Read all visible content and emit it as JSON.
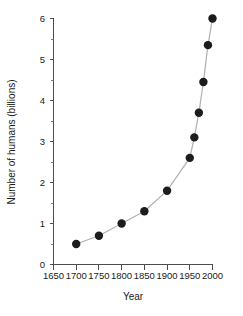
{
  "chart_data": {
    "type": "line",
    "title": "",
    "xlabel": "Year",
    "ylabel": "Number of humans (billions)",
    "xlim": [
      1650,
      2000
    ],
    "ylim": [
      0,
      6
    ],
    "grid": false,
    "legend": null,
    "marker": "filled-circle",
    "line_color": "#b0b0b0",
    "marker_color": "#1c1c1c",
    "x_ticks": [
      1650,
      1700,
      1750,
      1800,
      1850,
      1900,
      1950,
      2000
    ],
    "x_tick_labels": [
      "1650",
      "1700",
      "1750",
      "1800",
      "1850",
      "1900",
      "1950",
      "2000"
    ],
    "y_ticks": [
      0,
      1,
      2,
      3,
      4,
      5,
      6
    ],
    "y_tick_labels": [
      "0",
      "1",
      "2",
      "3",
      "4",
      "5",
      "6"
    ],
    "y_minor_ticks": [
      0.5,
      1.5,
      2.5,
      3.5,
      4.5,
      5.5
    ],
    "x": [
      1700,
      1750,
      1800,
      1850,
      1900,
      1950,
      1960,
      1970,
      1980,
      1990,
      2000
    ],
    "values": [
      0.5,
      0.7,
      1.0,
      1.3,
      1.8,
      2.6,
      3.1,
      3.7,
      4.45,
      5.35,
      6.0
    ],
    "series": [
      {
        "name": "World population",
        "points": [
          {
            "x": 1700,
            "y": 0.5
          },
          {
            "x": 1750,
            "y": 0.7
          },
          {
            "x": 1800,
            "y": 1.0
          },
          {
            "x": 1850,
            "y": 1.3
          },
          {
            "x": 1900,
            "y": 1.8
          },
          {
            "x": 1950,
            "y": 2.6
          },
          {
            "x": 1960,
            "y": 3.1
          },
          {
            "x": 1970,
            "y": 3.7
          },
          {
            "x": 1980,
            "y": 4.45
          },
          {
            "x": 1990,
            "y": 5.35
          },
          {
            "x": 2000,
            "y": 6.0
          }
        ]
      }
    ]
  },
  "axes": {
    "x_title": "Year",
    "y_title": "Number of humans (billions)"
  }
}
